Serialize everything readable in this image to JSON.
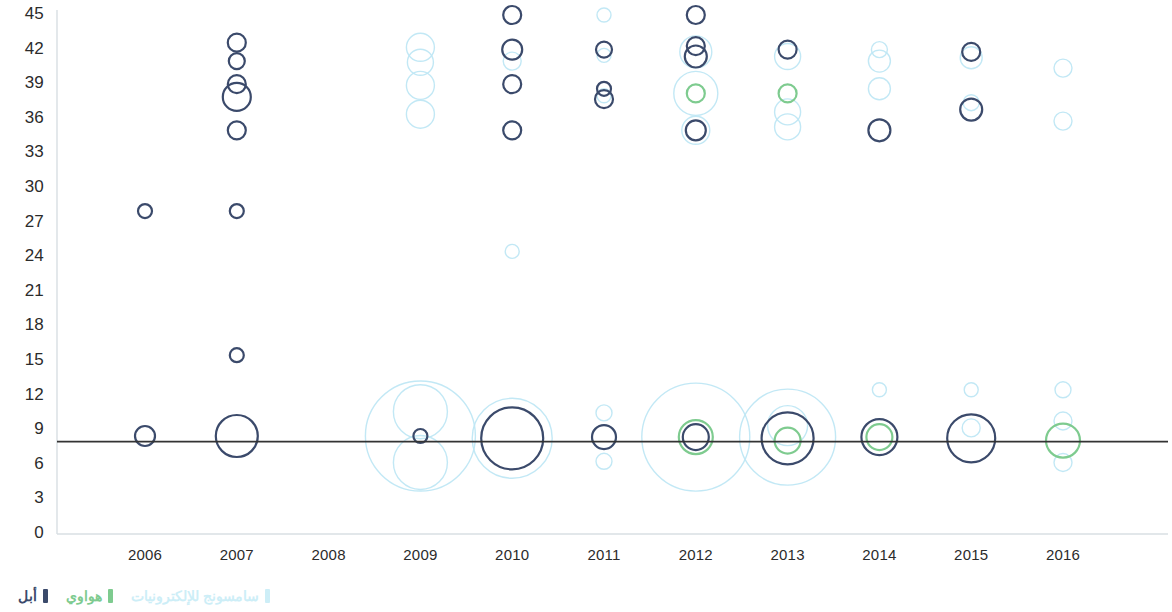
{
  "chart_data": {
    "type": "scatter",
    "title": "",
    "xlabel": "",
    "ylabel": "",
    "x_categories": [
      "2006",
      "2007",
      "2008",
      "2009",
      "2010",
      "2011",
      "2012",
      "2013",
      "2014",
      "2015",
      "2016"
    ],
    "y_ticks": [
      "45",
      "42",
      "39",
      "36",
      "33",
      "30",
      "27",
      "24",
      "21",
      "18",
      "15",
      "12",
      "9",
      "6",
      "3",
      "0"
    ],
    "ylim": [
      0,
      45
    ],
    "xlim": [
      2005.5,
      2016.5
    ],
    "grid": false,
    "reference_line": {
      "y": 8,
      "color": "#333333"
    },
    "legend": {
      "position": "bottom-right",
      "entries": [
        {
          "name": "apple",
          "label": "أبل",
          "color": "#3b4a6b"
        },
        {
          "name": "huawei",
          "label": "هواوي",
          "color": "#7ecb8f"
        },
        {
          "name": "samsung-electronics",
          "label": "سامسونج للإلكترونيات",
          "color": "#cdeef7"
        }
      ]
    },
    "series": [
      {
        "name": "أبل",
        "color": "#3b4a6b",
        "points": [
          {
            "x": 2006,
            "y": 28,
            "r": 7
          },
          {
            "x": 2006,
            "y": 8.5,
            "r": 10
          },
          {
            "x": 2007,
            "y": 42.6,
            "r": 9
          },
          {
            "x": 2007,
            "y": 41,
            "r": 8
          },
          {
            "x": 2007,
            "y": 39,
            "r": 9
          },
          {
            "x": 2007,
            "y": 37.9,
            "r": 14
          },
          {
            "x": 2007,
            "y": 35,
            "r": 9
          },
          {
            "x": 2007,
            "y": 28,
            "r": 7
          },
          {
            "x": 2007,
            "y": 15.5,
            "r": 7
          },
          {
            "x": 2007,
            "y": 8.5,
            "r": 21
          },
          {
            "x": 2009,
            "y": 8.5,
            "r": 7
          },
          {
            "x": 2010,
            "y": 45,
            "r": 9
          },
          {
            "x": 2010,
            "y": 42,
            "r": 10
          },
          {
            "x": 2010,
            "y": 39,
            "r": 9
          },
          {
            "x": 2010,
            "y": 35,
            "r": 9
          },
          {
            "x": 2010,
            "y": 8.3,
            "r": 31
          },
          {
            "x": 2011,
            "y": 42,
            "r": 8
          },
          {
            "x": 2011,
            "y": 38.6,
            "r": 7
          },
          {
            "x": 2011,
            "y": 37.7,
            "r": 9
          },
          {
            "x": 2011,
            "y": 8.4,
            "r": 12
          },
          {
            "x": 2012,
            "y": 45,
            "r": 9
          },
          {
            "x": 2012,
            "y": 42.3,
            "r": 9
          },
          {
            "x": 2012,
            "y": 41.4,
            "r": 11
          },
          {
            "x": 2012,
            "y": 35,
            "r": 10
          },
          {
            "x": 2012,
            "y": 8.4,
            "r": 13
          },
          {
            "x": 2013,
            "y": 42,
            "r": 9
          },
          {
            "x": 2013,
            "y": 8.3,
            "r": 26
          },
          {
            "x": 2014,
            "y": 35,
            "r": 11
          },
          {
            "x": 2014,
            "y": 8.4,
            "r": 18
          },
          {
            "x": 2015,
            "y": 41.8,
            "r": 9
          },
          {
            "x": 2015,
            "y": 36.8,
            "r": 11
          },
          {
            "x": 2015,
            "y": 8.3,
            "r": 24
          }
        ]
      },
      {
        "name": "هواوي",
        "color": "#7ecb8f",
        "points": [
          {
            "x": 2012,
            "y": 38.2,
            "r": 9
          },
          {
            "x": 2012,
            "y": 8.4,
            "r": 17
          },
          {
            "x": 2013,
            "y": 38.2,
            "r": 9
          },
          {
            "x": 2013,
            "y": 8.1,
            "r": 13
          },
          {
            "x": 2014,
            "y": 8.4,
            "r": 13
          },
          {
            "x": 2016,
            "y": 8.1,
            "r": 17
          }
        ]
      },
      {
        "name": "سامسونج للإلكترونيات",
        "color": "#bfe7f4",
        "points": [
          {
            "x": 2009,
            "y": 42.2,
            "r": 14
          },
          {
            "x": 2009,
            "y": 40.9,
            "r": 13
          },
          {
            "x": 2009,
            "y": 38.9,
            "r": 14
          },
          {
            "x": 2009,
            "y": 36.4,
            "r": 14
          },
          {
            "x": 2009,
            "y": 10.6,
            "r": 27
          },
          {
            "x": 2009,
            "y": 8.5,
            "r": 55
          },
          {
            "x": 2009,
            "y": 6.2,
            "r": 27
          },
          {
            "x": 2010,
            "y": 41,
            "r": 9
          },
          {
            "x": 2010,
            "y": 35,
            "r": 9
          },
          {
            "x": 2010,
            "y": 24.5,
            "r": 7
          },
          {
            "x": 2010,
            "y": 8.3,
            "r": 40
          },
          {
            "x": 2011,
            "y": 45,
            "r": 7
          },
          {
            "x": 2011,
            "y": 41.5,
            "r": 7
          },
          {
            "x": 2011,
            "y": 38,
            "r": 7
          },
          {
            "x": 2011,
            "y": 10.5,
            "r": 8
          },
          {
            "x": 2011,
            "y": 8.4,
            "r": 12
          },
          {
            "x": 2011,
            "y": 6.3,
            "r": 8
          },
          {
            "x": 2012,
            "y": 41.8,
            "r": 16
          },
          {
            "x": 2012,
            "y": 38.2,
            "r": 22
          },
          {
            "x": 2012,
            "y": 35,
            "r": 14
          },
          {
            "x": 2012,
            "y": 8.4,
            "r": 54
          },
          {
            "x": 2013,
            "y": 41.4,
            "r": 13
          },
          {
            "x": 2013,
            "y": 36.6,
            "r": 13
          },
          {
            "x": 2013,
            "y": 35.3,
            "r": 13
          },
          {
            "x": 2013,
            "y": 8.4,
            "r": 48
          },
          {
            "x": 2013,
            "y": 9.4,
            "r": 20
          },
          {
            "x": 2014,
            "y": 42,
            "r": 8
          },
          {
            "x": 2014,
            "y": 41,
            "r": 11
          },
          {
            "x": 2014,
            "y": 38.6,
            "r": 11
          },
          {
            "x": 2014,
            "y": 12.5,
            "r": 7
          },
          {
            "x": 2015,
            "y": 41.3,
            "r": 11
          },
          {
            "x": 2015,
            "y": 37.4,
            "r": 8
          },
          {
            "x": 2015,
            "y": 12.5,
            "r": 7
          },
          {
            "x": 2015,
            "y": 9.2,
            "r": 9
          },
          {
            "x": 2016,
            "y": 40.4,
            "r": 9
          },
          {
            "x": 2016,
            "y": 35.8,
            "r": 9
          },
          {
            "x": 2016,
            "y": 12.5,
            "r": 8
          },
          {
            "x": 2016,
            "y": 9.8,
            "r": 9
          },
          {
            "x": 2016,
            "y": 6.2,
            "r": 9
          }
        ]
      }
    ]
  }
}
